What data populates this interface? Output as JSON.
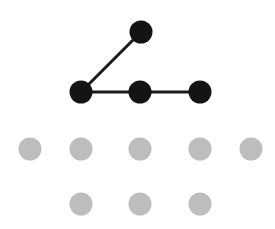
{
  "diagram": {
    "type": "graph-grid",
    "width": 275,
    "height": 229,
    "colors": {
      "background": "#ffffff",
      "active_node": "#141414",
      "edge": "#1a1a1a",
      "inactive_node": "#bdbdbd"
    },
    "node_radius": 11.5,
    "edge_width": 3,
    "active_nodes": [
      {
        "id": "a0",
        "x": 141,
        "y": 32
      },
      {
        "id": "a1",
        "x": 81,
        "y": 92
      },
      {
        "id": "a2",
        "x": 140,
        "y": 92
      },
      {
        "id": "a3",
        "x": 200,
        "y": 92
      }
    ],
    "edges": [
      {
        "from": "a1",
        "to": "a0"
      },
      {
        "from": "a1",
        "to": "a2"
      },
      {
        "from": "a2",
        "to": "a3"
      }
    ],
    "inactive_nodes": [
      {
        "id": "g0",
        "x": 30,
        "y": 149
      },
      {
        "id": "g1",
        "x": 81,
        "y": 149
      },
      {
        "id": "g2",
        "x": 140,
        "y": 149
      },
      {
        "id": "g3",
        "x": 200,
        "y": 149
      },
      {
        "id": "g4",
        "x": 251,
        "y": 149
      },
      {
        "id": "g5",
        "x": 81,
        "y": 204
      },
      {
        "id": "g6",
        "x": 140,
        "y": 204
      },
      {
        "id": "g7",
        "x": 200,
        "y": 204
      }
    ]
  }
}
